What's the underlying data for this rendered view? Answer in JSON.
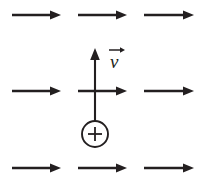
{
  "figure": {
    "width": 205,
    "height": 186,
    "background_color": "#ffffff",
    "ink_color": "#231f20"
  },
  "field": {
    "name": "uniform-field-arrows",
    "direction": "right",
    "rows": 3,
    "columns": 3,
    "row_y": [
      15,
      91,
      168
    ],
    "arrows": [
      {
        "id": "field-arrow-r1c1",
        "row": 1,
        "col": 1,
        "x_start": 12,
        "x_end": 61,
        "y": 15
      },
      {
        "id": "field-arrow-r1c2",
        "row": 1,
        "col": 2,
        "x_start": 78,
        "x_end": 127,
        "y": 15
      },
      {
        "id": "field-arrow-r1c3",
        "row": 1,
        "col": 3,
        "x_start": 144,
        "x_end": 194,
        "y": 15
      },
      {
        "id": "field-arrow-r2c1",
        "row": 2,
        "col": 1,
        "x_start": 12,
        "x_end": 61,
        "y": 91
      },
      {
        "id": "field-arrow-r2c2",
        "row": 2,
        "col": 2,
        "x_start": 78,
        "x_end": 127,
        "y": 91
      },
      {
        "id": "field-arrow-r2c3",
        "row": 2,
        "col": 3,
        "x_start": 144,
        "x_end": 194,
        "y": 91
      },
      {
        "id": "field-arrow-r3c1",
        "row": 3,
        "col": 1,
        "x_start": 12,
        "x_end": 61,
        "y": 168
      },
      {
        "id": "field-arrow-r3c2",
        "row": 3,
        "col": 2,
        "x_start": 78,
        "x_end": 127,
        "y": 168
      },
      {
        "id": "field-arrow-r3c3",
        "row": 3,
        "col": 3,
        "x_start": 144,
        "x_end": 194,
        "y": 168
      }
    ]
  },
  "velocity_vector": {
    "name": "velocity-arrow",
    "label": "v",
    "has_vector_accent": true,
    "direction": "up",
    "x": 95,
    "y_tail": 121,
    "y_tip": 48,
    "label_x": 112,
    "label_y": 66
  },
  "charge": {
    "name": "positive-charge",
    "symbol": "+",
    "sign": "positive",
    "center_x": 95,
    "center_y": 134,
    "radius": 13
  }
}
